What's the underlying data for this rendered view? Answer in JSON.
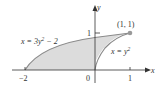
{
  "figure": {
    "region_fill": "#dcdcdc",
    "curve_color": "#8a8a8a",
    "axis_color": "#333333",
    "point_color": "#999999"
  },
  "axes": {
    "x_label": "x",
    "y_label": "y",
    "origin_label": "0",
    "x_ticks": [
      "−2",
      "1"
    ],
    "y_ticks": [
      "1"
    ]
  },
  "curves": [
    {
      "name": "left-curve",
      "equation_lhs": "x = 3y",
      "exponent": "2",
      "equation_rhs": " − 2"
    },
    {
      "name": "right-curve",
      "equation_lhs": "x = y",
      "exponent": "2",
      "equation_rhs": ""
    }
  ],
  "points": [
    {
      "label": "(1, 1)",
      "x": 1,
      "y": 1
    }
  ]
}
